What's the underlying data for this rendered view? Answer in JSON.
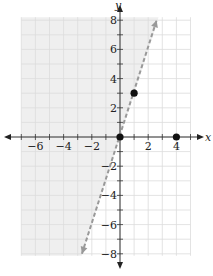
{
  "chart_data": {
    "type": "line",
    "title": "",
    "xlabel": "x",
    "ylabel": "y",
    "xlim": [
      -7,
      5
    ],
    "ylim": [
      -8,
      8
    ],
    "grid": true,
    "grid_step": 1,
    "x_ticks": [
      -6,
      -4,
      -2,
      2,
      4
    ],
    "y_ticks": [
      -8,
      -6,
      -4,
      -2,
      2,
      4,
      6,
      8
    ],
    "x_tick_labels": [
      "−6",
      "−4",
      "−2",
      "2",
      "4"
    ],
    "y_tick_labels": [
      "−8",
      "−6",
      "−4",
      "−2",
      "2",
      "4",
      "6",
      "8"
    ],
    "boundary_line": {
      "equation": "y = 3x",
      "style": "dashed",
      "from": [
        -2.7,
        -8
      ],
      "to": [
        2.6,
        8
      ],
      "color": "#999999",
      "arrows": "both"
    },
    "shaded_region": {
      "inequality": "y > 3x",
      "side": "left/above line",
      "color": "#efefef"
    },
    "points": [
      {
        "x": 0,
        "y": 0
      },
      {
        "x": 1,
        "y": 3
      },
      {
        "x": 4,
        "y": 0
      }
    ]
  },
  "axis_labels": {
    "x": "x",
    "y": "y"
  }
}
